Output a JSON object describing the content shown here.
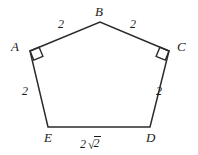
{
  "figure": {
    "shape_name": "pentagon",
    "background_color": "#ffffff",
    "stroke_color": "#2b2b2b",
    "text_color": "#1a1a1a",
    "vertices": [
      {
        "id": "A",
        "label": "A",
        "x": 30,
        "y": 51,
        "right_angle": true
      },
      {
        "id": "B",
        "label": "B",
        "x": 100,
        "y": 22,
        "right_angle": false
      },
      {
        "id": "C",
        "label": "C",
        "x": 169,
        "y": 51,
        "right_angle": true
      },
      {
        "id": "D",
        "label": "D",
        "x": 150,
        "y": 127,
        "right_angle": false
      },
      {
        "id": "E",
        "label": "E",
        "x": 48,
        "y": 127,
        "right_angle": false
      }
    ],
    "vertex_label_positions": [
      {
        "id": "A",
        "x": 11,
        "y": 40
      },
      {
        "id": "B",
        "x": 95,
        "y": 5
      },
      {
        "id": "C",
        "x": 177,
        "y": 40
      },
      {
        "id": "D",
        "x": 146,
        "y": 131
      },
      {
        "id": "E",
        "x": 44,
        "y": 131
      }
    ],
    "edges": [
      {
        "from": "A",
        "to": "B",
        "length_label": "2",
        "label_x": 58,
        "label_y": 18
      },
      {
        "from": "B",
        "to": "C",
        "length_label": "2",
        "label_x": 130,
        "label_y": 18
      },
      {
        "from": "C",
        "to": "D",
        "length_label": "2",
        "label_x": 156,
        "label_y": 85
      },
      {
        "from": "D",
        "to": "E",
        "length_label": "2√2",
        "label_x": 80,
        "label_y": 135,
        "is_radical": true,
        "coefficient": "2",
        "radicand": "2"
      },
      {
        "from": "E",
        "to": "A",
        "length_label": "2",
        "label_x": 22,
        "label_y": 85
      }
    ],
    "right_angle_marker_size": 10
  }
}
